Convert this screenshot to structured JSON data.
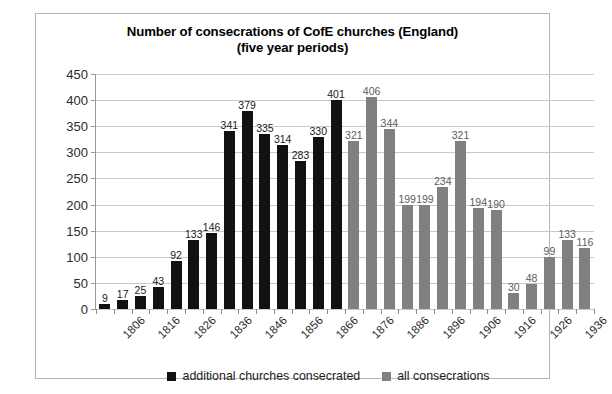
{
  "chart_data": {
    "type": "bar",
    "title": "Number of consecrations of CofE churches (England)",
    "subtitle": "(five year periods)",
    "xlabel": "",
    "ylabel": "",
    "ylim": [
      0,
      450
    ],
    "ytick_step": 50,
    "yticks": [
      450,
      400,
      350,
      300,
      250,
      200,
      150,
      100,
      50,
      0
    ],
    "grid": true,
    "legend_position": "bottom",
    "categories": [
      "1806",
      "1811",
      "1816",
      "1821",
      "1826",
      "1831",
      "1836",
      "1841",
      "1846",
      "1851",
      "1856",
      "1861",
      "1866",
      "1871",
      "1876",
      "1881",
      "1886",
      "1891",
      "1896",
      "1901",
      "1906",
      "1911",
      "1916",
      "1921",
      "1926",
      "1931",
      "1936",
      "1941"
    ],
    "xtick_labels_shown": [
      "1806",
      "",
      "1816",
      "",
      "1826",
      "",
      "1836",
      "",
      "1846",
      "",
      "1856",
      "",
      "1866",
      "",
      "1876",
      "",
      "1886",
      "",
      "1896",
      "",
      "1906",
      "",
      "1916",
      "",
      "1926",
      "",
      "1936",
      ""
    ],
    "series": [
      {
        "name": "additional churches consecrated",
        "color": "#111111",
        "values": [
          9,
          17,
          25,
          43,
          92,
          133,
          146,
          341,
          379,
          335,
          314,
          283,
          330,
          401,
          null,
          null,
          null,
          null,
          null,
          null,
          null,
          null,
          null,
          null,
          null,
          null,
          null,
          null
        ]
      },
      {
        "name": "all consecrations",
        "color": "#808080",
        "values": [
          null,
          null,
          null,
          null,
          null,
          null,
          null,
          null,
          null,
          null,
          null,
          null,
          null,
          null,
          321,
          406,
          344,
          199,
          199,
          234,
          321,
          194,
          190,
          30,
          48,
          99,
          133,
          116
        ]
      }
    ],
    "bar_values_in_order": [
      {
        "value": 9,
        "series": 0
      },
      {
        "value": 17,
        "series": 0
      },
      {
        "value": 25,
        "series": 0
      },
      {
        "value": 43,
        "series": 0
      },
      {
        "value": 92,
        "series": 0
      },
      {
        "value": 133,
        "series": 0
      },
      {
        "value": 146,
        "series": 0
      },
      {
        "value": 341,
        "series": 0
      },
      {
        "value": 379,
        "series": 0
      },
      {
        "value": 335,
        "series": 0
      },
      {
        "value": 314,
        "series": 0
      },
      {
        "value": 283,
        "series": 0
      },
      {
        "value": 330,
        "series": 0
      },
      {
        "value": 401,
        "series": 0
      },
      {
        "value": 321,
        "series": 1
      },
      {
        "value": 406,
        "series": 1
      },
      {
        "value": 344,
        "series": 1
      },
      {
        "value": 199,
        "series": 1
      },
      {
        "value": 199,
        "series": 1
      },
      {
        "value": 234,
        "series": 1
      },
      {
        "value": 321,
        "series": 1
      },
      {
        "value": 194,
        "series": 1
      },
      {
        "value": 190,
        "series": 1
      },
      {
        "value": 30,
        "series": 1
      },
      {
        "value": 48,
        "series": 1
      },
      {
        "value": 99,
        "series": 1
      },
      {
        "value": 133,
        "series": 1
      },
      {
        "value": 116,
        "series": 1
      }
    ]
  },
  "legend": {
    "items": [
      {
        "label": "additional churches consecrated",
        "color": "#111111"
      },
      {
        "label": "all consecrations",
        "color": "#808080"
      }
    ]
  },
  "colors": {
    "series_black": "#111111",
    "series_grey": "#808080",
    "gridline": "#c9c9c9",
    "frame": "#b6b6b6",
    "background": "#ffffff"
  }
}
